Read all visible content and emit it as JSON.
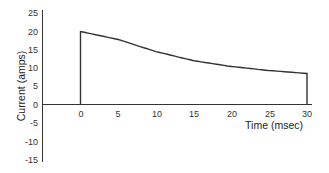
{
  "chart_data": {
    "type": "line",
    "title": "",
    "xlabel": "Time (msec)",
    "ylabel": "Current (amps)",
    "xlim": [
      0,
      30
    ],
    "ylim": [
      -15,
      25
    ],
    "xticks": [
      0,
      5,
      10,
      15,
      20,
      25,
      30
    ],
    "yticks": [
      25,
      20,
      15,
      10,
      5,
      0,
      -5,
      -10,
      -15
    ],
    "grid": false,
    "legend": null,
    "series": [
      {
        "name": "Current",
        "x": [
          0,
          0,
          5,
          10,
          15,
          20,
          25,
          30,
          30
        ],
        "y": [
          0,
          20,
          17.8,
          14.5,
          12,
          10.4,
          9.3,
          8.5,
          0
        ]
      }
    ],
    "annotations": [
      "Vertical rise from 0 to 20 A at t=0",
      "Vertical drop to 0 at t=30 msec"
    ]
  },
  "labels": {
    "x_axis": "Time (msec)",
    "y_axis": "Current (amps)",
    "x_ticks": [
      "0",
      "5",
      "10",
      "15",
      "20",
      "25",
      "30"
    ],
    "y_ticks": [
      "25",
      "20",
      "15",
      "10",
      "5",
      "0",
      "-5",
      "-10",
      "-15"
    ]
  }
}
